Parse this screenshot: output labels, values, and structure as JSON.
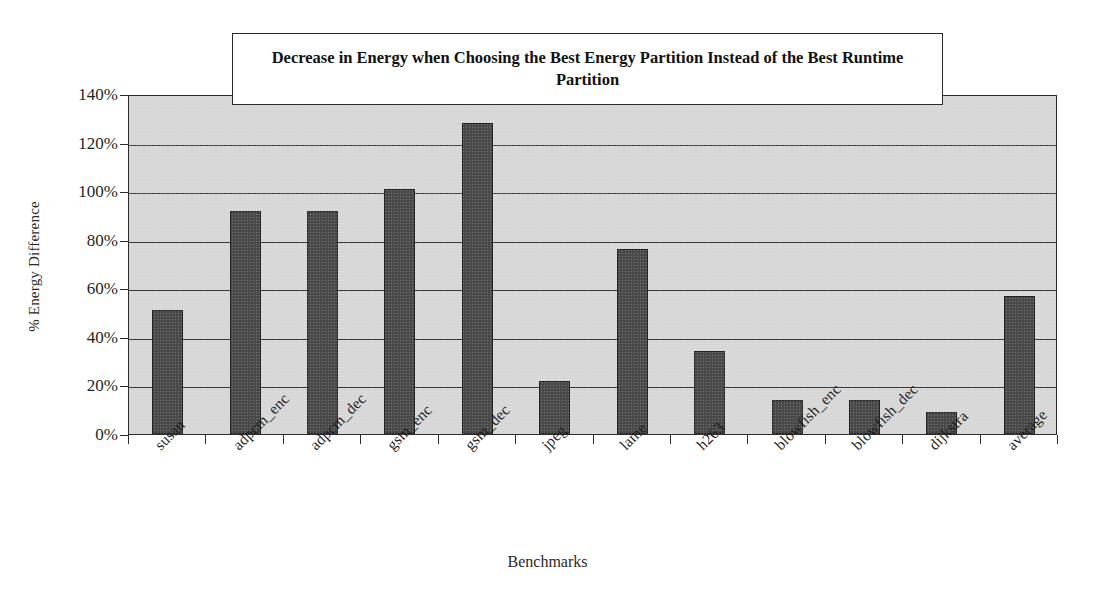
{
  "chart_data": {
    "type": "bar",
    "title": "Decrease in Energy when Choosing the Best Energy Partition Instead of the Best Runtime Partition",
    "xlabel": "Benchmarks",
    "ylabel": "% Energy Difference",
    "categories": [
      "susan",
      "adpcm_enc",
      "adpcm_dec",
      "gsm_enc",
      "gsm_dec",
      "jpeg",
      "lame",
      "h263",
      "blowfish_enc",
      "blowfish_dec",
      "dijkstra",
      "average"
    ],
    "values": [
      51,
      92,
      92,
      101,
      128,
      22,
      76,
      34,
      14,
      14,
      9,
      57
    ],
    "ylim": [
      0,
      140
    ],
    "ytick_step": 20,
    "ytick_labels": [
      "0%",
      "20%",
      "40%",
      "60%",
      "80%",
      "100%",
      "120%",
      "140%"
    ],
    "grid": true,
    "legend": "none",
    "series_name": "% Energy Difference",
    "colors": {
      "bar_fill": "#4a4a4a",
      "bar_stroke": "#232323",
      "plot_background": "#d7d7d7",
      "axis": "#2b2b2b",
      "gridline": "#3a3a3a",
      "text": "#1a1a1a",
      "title_box_background": "#ffffff"
    }
  }
}
